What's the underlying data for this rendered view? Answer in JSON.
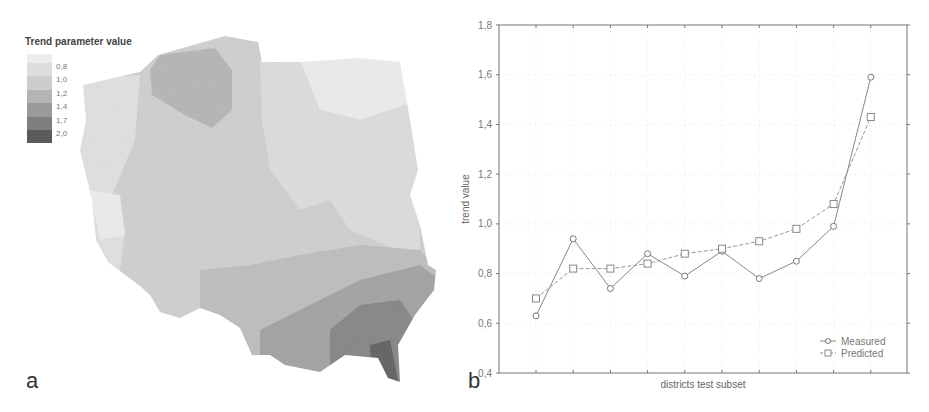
{
  "panel_a": {
    "letter": "a",
    "legend": {
      "title": "Trend parameter value",
      "labels": [
        "0,8",
        "1,0",
        "1,2",
        "1,4",
        "1,7",
        "2,0"
      ],
      "colors": [
        "#ececec",
        "#dddddd",
        "#cdcdcd",
        "#b4b4b4",
        "#9a9a9a",
        "#7e7e7e",
        "#5a5a5a"
      ]
    }
  },
  "panel_b": {
    "letter": "b"
  },
  "chart_data": [
    {
      "type": "choropleth-map",
      "title": "Trend parameter value",
      "legend": {
        "breaks": [
          0.8,
          1.0,
          1.2,
          1.4,
          1.7,
          2.0
        ],
        "labels": [
          "0,8",
          "1,0",
          "1,2",
          "1,4",
          "1,7",
          "2,0"
        ],
        "position": "top-left"
      },
      "description": "Map of Poland districts shaded by trend parameter; darkest values (~2.0) in the south-east, lightest (~0.8) in the north-east and west."
    },
    {
      "type": "line",
      "title": "",
      "xlabel": "districts test subset",
      "ylabel": "trend value",
      "ylim": [
        0.4,
        1.8
      ],
      "yticks": [
        "0,4",
        "0,6",
        "0,8",
        "1,0",
        "1,2",
        "1,4",
        "1,6",
        "1,8"
      ],
      "ytick_values": [
        0.4,
        0.6,
        0.8,
        1.0,
        1.2,
        1.4,
        1.6,
        1.8
      ],
      "x": [
        1,
        2,
        3,
        4,
        5,
        6,
        7,
        8,
        9,
        10
      ],
      "grid": true,
      "legend_position": "bottom-right",
      "series": [
        {
          "name": "Measured",
          "marker": "circle",
          "line": "solid",
          "values": [
            0.63,
            0.94,
            0.74,
            0.88,
            0.79,
            0.89,
            0.78,
            0.85,
            0.99,
            1.59
          ]
        },
        {
          "name": "Predicted",
          "marker": "square",
          "line": "dashed",
          "values": [
            0.7,
            0.82,
            0.82,
            0.84,
            0.88,
            0.9,
            0.93,
            0.98,
            1.08,
            1.43
          ]
        }
      ]
    }
  ]
}
